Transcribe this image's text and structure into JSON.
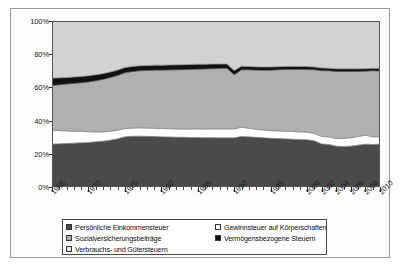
{
  "chart_data": {
    "type": "area",
    "title": "",
    "subtitle": "",
    "xlabel": "",
    "ylabel": "",
    "stacked": true,
    "normalized": "100%",
    "grid": false,
    "legend_position": "bottom",
    "ylim": [
      0,
      100
    ],
    "ytick_labels": [
      "0%",
      "20%",
      "40%",
      "60%",
      "80%",
      "100%"
    ],
    "ytick_values": [
      0,
      20,
      40,
      60,
      80,
      100
    ],
    "xtick_labels": [
      "1965",
      "1970",
      "1975",
      "1980",
      "1985",
      "1990",
      "1995",
      "2000",
      "2002",
      "2004",
      "2006",
      "2008",
      "2010"
    ],
    "xtick_values": [
      1965,
      1970,
      1975,
      1980,
      1985,
      1990,
      1995,
      2000,
      2002,
      2004,
      2006,
      2008,
      2010
    ],
    "xlim": [
      1965,
      2010
    ],
    "x": [
      1965,
      1966,
      1967,
      1968,
      1969,
      1970,
      1971,
      1972,
      1973,
      1974,
      1975,
      1976,
      1977,
      1978,
      1979,
      1980,
      1981,
      1982,
      1983,
      1984,
      1985,
      1986,
      1987,
      1988,
      1989,
      1990,
      1991,
      1992,
      1993,
      1994,
      1995,
      1996,
      1997,
      1998,
      1999,
      2000,
      2001,
      2002,
      2003,
      2004,
      2005,
      2006,
      2007,
      2008,
      2009,
      2010
    ],
    "series": [
      {
        "name": "Persönliche Einkommensteuer",
        "color": "#4a4a4a",
        "values": [
          25.8,
          26.0,
          26.2,
          26.4,
          26.6,
          26.8,
          27.2,
          27.6,
          28.2,
          29.0,
          30.2,
          30.5,
          30.6,
          30.5,
          30.4,
          30.2,
          30.1,
          30.0,
          29.9,
          29.8,
          29.8,
          29.7,
          29.7,
          29.6,
          29.6,
          29.6,
          30.4,
          30.2,
          29.9,
          29.6,
          29.3,
          29.2,
          29.0,
          28.8,
          28.6,
          28.4,
          27.8,
          25.9,
          25.6,
          24.6,
          24.4,
          24.6,
          25.2,
          25.8,
          25.6,
          25.8
        ]
      },
      {
        "name": "Gewinnsteuer auf Körperschaften",
        "color": "#ffffff",
        "values": [
          8.4,
          8.0,
          7.6,
          7.2,
          7.0,
          6.5,
          6.0,
          5.6,
          5.4,
          5.2,
          5.0,
          5.0,
          5.0,
          5.0,
          5.0,
          5.0,
          5.0,
          5.0,
          5.0,
          5.1,
          5.2,
          5.2,
          5.3,
          5.4,
          5.4,
          5.4,
          5.6,
          5.2,
          4.9,
          4.7,
          4.6,
          4.6,
          4.6,
          4.6,
          4.6,
          4.6,
          4.4,
          4.6,
          4.5,
          4.6,
          4.8,
          5.0,
          5.2,
          5.4,
          4.6,
          4.5
        ]
      },
      {
        "name": "Sozialversicherungsbeiträge",
        "color": "#b0b0b0",
        "values": [
          27.0,
          27.6,
          28.2,
          28.8,
          29.2,
          30.0,
          30.8,
          31.6,
          32.3,
          33.0,
          33.6,
          34.0,
          34.4,
          34.7,
          35.0,
          35.2,
          35.4,
          35.6,
          35.8,
          35.9,
          36.0,
          36.2,
          36.3,
          36.4,
          36.5,
          32.6,
          34.6,
          35.2,
          35.6,
          36.0,
          36.4,
          36.8,
          37.2,
          37.4,
          37.6,
          37.8,
          38.4,
          39.6,
          39.9,
          40.4,
          40.4,
          40.0,
          39.2,
          38.6,
          39.8,
          39.6
        ]
      },
      {
        "name": "Vermögensbezogene Steuern",
        "color": "#111111",
        "values": [
          4.4,
          4.2,
          4.0,
          3.9,
          3.8,
          3.7,
          3.6,
          3.5,
          3.4,
          3.3,
          3.2,
          3.1,
          3.0,
          3.0,
          3.0,
          3.0,
          3.0,
          3.0,
          3.0,
          3.0,
          3.0,
          2.9,
          2.8,
          2.7,
          2.6,
          2.6,
          2.2,
          2.0,
          2.0,
          2.0,
          2.0,
          1.9,
          1.8,
          1.8,
          1.8,
          1.8,
          1.7,
          1.6,
          1.6,
          1.6,
          1.6,
          1.6,
          1.6,
          1.5,
          1.5,
          1.5
        ]
      },
      {
        "name": "Verbrauchs- und Gütersteuern",
        "color": "#d2d2d2",
        "values": [
          34.4,
          34.2,
          34.0,
          33.7,
          33.4,
          33.0,
          32.4,
          31.7,
          30.7,
          29.5,
          28.0,
          27.4,
          27.0,
          26.8,
          26.6,
          26.6,
          26.5,
          26.4,
          26.3,
          26.2,
          26.0,
          26.0,
          25.9,
          25.9,
          25.9,
          29.8,
          27.2,
          27.4,
          27.6,
          27.7,
          27.7,
          27.5,
          27.4,
          27.4,
          27.4,
          27.4,
          27.7,
          28.3,
          28.4,
          28.8,
          28.8,
          28.8,
          28.8,
          28.7,
          28.5,
          28.6
        ]
      }
    ],
    "legend": [
      {
        "label": "Persönliche Einkommensteuer",
        "color": "#4a4a4a"
      },
      {
        "label": "Gewinnsteuer auf Körperschaften",
        "color": "#ffffff"
      },
      {
        "label": "Sozialversicherungsbeiträge",
        "color": "#b0b0b0"
      },
      {
        "label": "Vermögensbezogene Steuern",
        "color": "#111111"
      },
      {
        "label": "Verbrauchs- und Gütersteuern",
        "color": "#e8e8e8"
      }
    ]
  }
}
